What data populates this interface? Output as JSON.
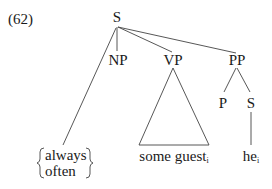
{
  "example_number": "(62)",
  "tree": {
    "root": "S",
    "children": [
      {
        "label": "NP"
      },
      {
        "label": "VP",
        "terminal": "some guest",
        "terminal_index": "i",
        "triangle": true
      },
      {
        "label": "PP",
        "children": [
          {
            "label": "P"
          },
          {
            "label": "S",
            "terminal": "he",
            "terminal_index": "i"
          }
        ]
      }
    ],
    "adverb_options": [
      "always",
      "often"
    ]
  },
  "labels": {
    "root": "S",
    "np": "NP",
    "vp": "VP",
    "pp": "PP",
    "p": "P",
    "s2": "S",
    "some_guest": "some guest",
    "some_guest_index": "i",
    "he": "he",
    "he_index": "i",
    "adv1": "always",
    "adv2": "often"
  }
}
